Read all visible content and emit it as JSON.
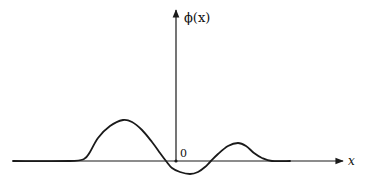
{
  "figure": {
    "y_label": "ϕ(x)",
    "x_label": "x",
    "origin_label": "0",
    "colors": {
      "ink": "#1a1a1a",
      "background": "#ffffff"
    }
  },
  "chart_data": {
    "type": "line",
    "title": "",
    "xlabel": "x",
    "ylabel": "ϕ(x)",
    "series": [
      {
        "name": "ϕ(x)",
        "points_px": [
          [
            13,
            161
          ],
          [
            70,
            161
          ],
          [
            84,
            159
          ],
          [
            90,
            152
          ],
          [
            98,
            138
          ],
          [
            110,
            126
          ],
          [
            123,
            120
          ],
          [
            132,
            122
          ],
          [
            142,
            130
          ],
          [
            152,
            142
          ],
          [
            160,
            153
          ],
          [
            166,
            161
          ],
          [
            172,
            168
          ],
          [
            180,
            172
          ],
          [
            190,
            174
          ],
          [
            198,
            172
          ],
          [
            205,
            167
          ],
          [
            210,
            162
          ],
          [
            218,
            154
          ],
          [
            228,
            146
          ],
          [
            238,
            143
          ],
          [
            246,
            146
          ],
          [
            254,
            153
          ],
          [
            262,
            158
          ],
          [
            272,
            161
          ],
          [
            290,
            161
          ]
        ]
      }
    ],
    "axes": {
      "x_axis": {
        "y_px": 161,
        "from_px": 13,
        "to_px": 343
      },
      "y_axis": {
        "x_px": 176,
        "from_px": 161,
        "to_px": 9
      }
    },
    "grid": false,
    "legend": null
  }
}
